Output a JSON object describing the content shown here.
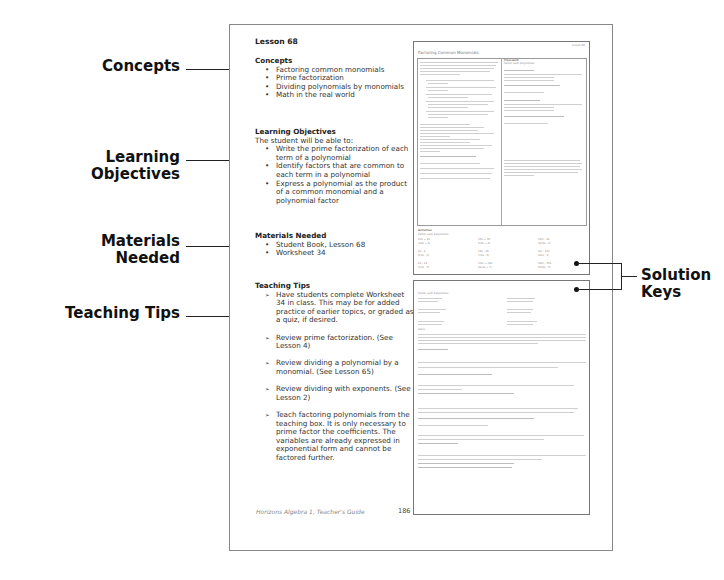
{
  "callouts": {
    "left": [
      {
        "label": "Concepts"
      },
      {
        "label": "Learning Objectives"
      },
      {
        "label": "Materials Needed"
      },
      {
        "label": "Teaching Tips"
      }
    ],
    "right": {
      "label_line1": "Solution",
      "label_line2": "Keys"
    }
  },
  "page": {
    "lesson_title": "Lesson 68",
    "concepts": {
      "heading": "Concepts",
      "items": [
        "Factoring common monomials",
        "Prime factorization",
        "Dividing polynomials by monomials",
        "Math in the real world"
      ]
    },
    "learning_objectives": {
      "heading": "Learning Objectives",
      "intro": "The student will be able to:",
      "items": [
        "Write the prime factorization of each term of a polynomial",
        "Identify factors that are common to each term in a polynomial",
        "Express a polynomial as the product of a common monomial and a polynomial factor"
      ]
    },
    "materials_needed": {
      "heading": "Materials Needed",
      "items": [
        "Student Book, Lesson 68",
        "Worksheet 34"
      ]
    },
    "teaching_tips": {
      "heading": "Teaching Tips",
      "items": [
        "Have students complete Worksheet 34 in class.  This may be for added practice of earlier topics, or graded as a quiz, if desired.",
        "Review prime factorization. (See Lesson 4)",
        "Review dividing a polynomial by a monomial. (See Lesson 65)",
        "Review dividing with exponents. (See Lesson 2)",
        "Teach factoring polynomials from the teaching box.  It is only necessary to prime factor the coefficients.  The variables are already expressed in exponential form and cannot be factored further."
      ]
    },
    "footer": "Horizons Algebra 1, Teacher's Guide",
    "page_number": "186"
  },
  "thumbnail_top": {
    "lesson_tag": "Lesson 68",
    "title": "Factoring Common Monomials",
    "classwork_heading": "Classwork",
    "classwork_prompt": "Factor each polynomial.",
    "activities_heading": "Activities",
    "activities_prompt": "Factor each polynomial.",
    "activities": [
      [
        "12x + 15",
        "3(4x + 5)"
      ],
      [
        "15x + 20",
        "5(3x + 4)"
      ],
      [
        "15x² - 6x",
        "3x(5x - 2)"
      ],
      [
        "8x - 4",
        "4(2x - 1)"
      ],
      [
        "14x - 35",
        "7(2x - 5)"
      ],
      [
        "4x² - 12x",
        "4x(x - 3)"
      ],
      [
        "6x - 14",
        "2(3x - 7)"
      ],
      [
        "12x² + 28x",
        "4x(3x + 7)"
      ],
      [
        "20x² - 25x",
        "5x(4x - 5)"
      ]
    ]
  },
  "thumbnail_bottom": {
    "prompt": "Factor each polynomial.",
    "solve_heading": "Solve."
  }
}
